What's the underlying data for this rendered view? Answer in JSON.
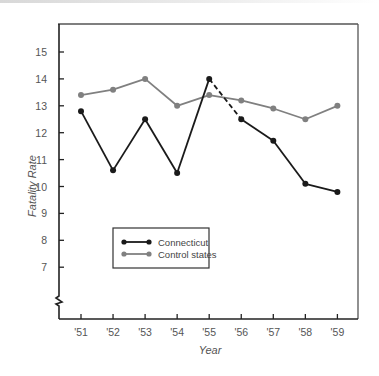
{
  "chart_data": {
    "type": "line",
    "title": "",
    "xlabel": "Year",
    "ylabel": "Fatality Rate",
    "categories": [
      "'51",
      "'52",
      "'53",
      "'54",
      "'55",
      "'56",
      "'57",
      "'58",
      "'59"
    ],
    "series": [
      {
        "name": "Connecticut",
        "color": "#1a1a1a",
        "values": [
          12.8,
          10.6,
          12.5,
          10.5,
          14.0,
          12.5,
          11.7,
          10.1,
          9.8
        ],
        "note": "Segment from '55 to '56 drawn dashed"
      },
      {
        "name": "Control states",
        "color": "#808080",
        "values": [
          13.4,
          13.6,
          14.0,
          13.0,
          13.4,
          13.2,
          12.9,
          12.5,
          13.0
        ]
      }
    ],
    "yticks": [
      "7",
      "8",
      "9",
      "10",
      "11",
      "12",
      "13",
      "14",
      "15"
    ],
    "ylim": [
      5.8,
      16
    ],
    "axis_break": true,
    "grid": false,
    "legend_position": "inside-lower-left"
  },
  "legend": {
    "items": [
      {
        "label": "Connecticut",
        "color": "#1a1a1a"
      },
      {
        "label": "Control states",
        "color": "#808080"
      }
    ]
  },
  "axes": {
    "x_title": "Year",
    "y_title": "Fatality Rate"
  }
}
